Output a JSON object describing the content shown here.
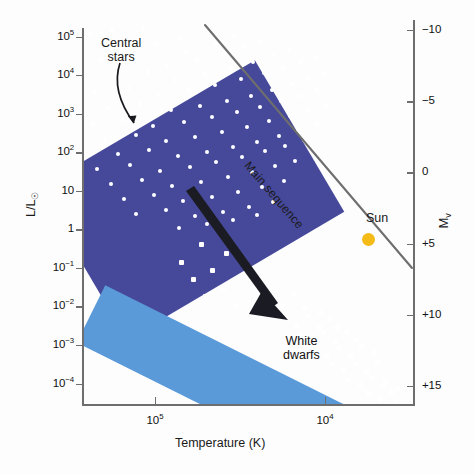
{
  "figure": {
    "kind": "hertzsprung-russell-diagram"
  },
  "axes": {
    "y_title_main": "L/L",
    "y_title_sub": "☉",
    "x_title": "Temperature (K)",
    "m_title_main": "M",
    "m_title_sub": "v",
    "y_ticks": [
      {
        "mantissa": "10",
        "exp": "5",
        "value": 100000
      },
      {
        "mantissa": "10",
        "exp": "4",
        "value": 10000
      },
      {
        "mantissa": "10",
        "exp": "3",
        "value": 1000
      },
      {
        "mantissa": "10",
        "exp": "2",
        "value": 100
      },
      {
        "mantissa": "10",
        "exp": "",
        "value": 10
      },
      {
        "mantissa": "1",
        "exp": "",
        "value": 1
      },
      {
        "mantissa": "10",
        "exp": "−1",
        "value": 0.1
      },
      {
        "mantissa": "10",
        "exp": "−2",
        "value": 0.01
      },
      {
        "mantissa": "10",
        "exp": "−3",
        "value": 0.001
      },
      {
        "mantissa": "10",
        "exp": "−4",
        "value": 0.0001
      }
    ],
    "x_ticks": [
      {
        "mantissa": "10",
        "exp": "5",
        "value": 100000
      },
      {
        "mantissa": "10",
        "exp": "4",
        "value": 10000
      }
    ],
    "m_ticks": [
      "−10",
      "−5",
      "0",
      "+5",
      "+10",
      "+15"
    ]
  },
  "annotations": {
    "central_stars_line1": "Central",
    "central_stars_line2": "stars",
    "white_dwarfs_line1": "White",
    "white_dwarfs_line2": "dwarfs",
    "main_sequence": "Main sequence",
    "sun": "Sun"
  },
  "colors": {
    "central_band": "#46499A",
    "white_dwarf_band": "#5B9AD8",
    "sun_marker": "#F4BA16",
    "axis": "#6E6E6E",
    "star_marker": "#FFFFFF",
    "evolution_arrow": "#1B1B23",
    "background": "#FDFDFD"
  },
  "chart_data": {
    "type": "scatter",
    "title": "",
    "xlabel": "Temperature (K)",
    "ylabel": "L/L☉",
    "y2label": "M_v",
    "xscale": "log-reversed",
    "yscale": "log",
    "xlim": [
      300000,
      7000
    ],
    "ylim": [
      3e-05,
      300000
    ],
    "y2lim": [
      -12,
      17
    ],
    "grid": false,
    "legend": "none",
    "xtick_values": [
      100000,
      10000
    ],
    "ytick_values": [
      100000,
      10000,
      1000,
      100,
      10,
      1,
      0.1,
      0.01,
      0.001,
      0.0001
    ],
    "y2tick_values": [
      -10,
      -5,
      0,
      5,
      10,
      15
    ],
    "regions": [
      {
        "name": "Central stars of planetary nebulae",
        "label": "Central stars",
        "color": "#46499A",
        "shape": "rotated-rectangle",
        "approx_luminosity_range": [
          3,
          100000
        ],
        "approx_temperature_range": [
          200000,
          25000
        ]
      },
      {
        "name": "White dwarf cooling track",
        "label": "White dwarfs",
        "color": "#5B9AD8",
        "shape": "rotated-band",
        "approx_luminosity_range": [
          8e-05,
          8
        ],
        "approx_temperature_range": [
          150000,
          7000
        ]
      }
    ],
    "series": [
      {
        "name": "Central stars",
        "marker": "white circle",
        "count": 108,
        "points": [
          [
            5,
            12
          ],
          [
            27,
            8
          ],
          [
            58,
            5
          ],
          [
            96,
            17
          ],
          [
            119,
            6
          ],
          [
            40,
            24
          ],
          [
            71,
            21
          ],
          [
            101,
            29
          ],
          [
            131,
            22
          ],
          [
            149,
            13
          ],
          [
            16,
            38
          ],
          [
            49,
            34
          ],
          [
            82,
            44
          ],
          [
            112,
            37
          ],
          [
            138,
            32
          ],
          [
            160,
            25
          ],
          [
            176,
            19
          ],
          [
            30,
            55
          ],
          [
            63,
            50
          ],
          [
            90,
            58
          ],
          [
            120,
            52
          ],
          [
            146,
            46
          ],
          [
            168,
            40
          ],
          [
            188,
            33
          ],
          [
            204,
            28
          ],
          [
            10,
            70
          ],
          [
            44,
            66
          ],
          [
            74,
            73
          ],
          [
            104,
            68
          ],
          [
            130,
            63
          ],
          [
            156,
            57
          ],
          [
            179,
            51
          ],
          [
            198,
            45
          ],
          [
            216,
            40
          ],
          [
            231,
            35
          ],
          [
            23,
            86
          ],
          [
            55,
            82
          ],
          [
            86,
            88
          ],
          [
            115,
            84
          ],
          [
            142,
            79
          ],
          [
            166,
            74
          ],
          [
            187,
            68
          ],
          [
            207,
            62
          ],
          [
            224,
            57
          ],
          [
            240,
            51
          ],
          [
            8,
            101
          ],
          [
            38,
            98
          ],
          [
            68,
            104
          ],
          [
            99,
            100
          ],
          [
            127,
            95
          ],
          [
            152,
            90
          ],
          [
            175,
            85
          ],
          [
            196,
            79
          ],
          [
            214,
            74
          ],
          [
            232,
            68
          ],
          [
            20,
            117
          ],
          [
            51,
            113
          ],
          [
            81,
            119
          ],
          [
            110,
            115
          ],
          [
            137,
            110
          ],
          [
            162,
            105
          ],
          [
            184,
            99
          ],
          [
            205,
            94
          ],
          [
            223,
            88
          ],
          [
            241,
            83
          ],
          [
            33,
            132
          ],
          [
            64,
            128
          ],
          [
            93,
            134
          ],
          [
            122,
            130
          ],
          [
            148,
            125
          ],
          [
            172,
            120
          ],
          [
            194,
            114
          ],
          [
            213,
            109
          ],
          [
            232,
            103
          ],
          [
            12,
            147
          ],
          [
            45,
            143
          ],
          [
            75,
            149
          ],
          [
            105,
            145
          ],
          [
            131,
            140
          ],
          [
            157,
            135
          ],
          [
            180,
            129
          ],
          [
            200,
            124
          ],
          [
            219,
            118
          ],
          [
            26,
            162
          ],
          [
            57,
            158
          ],
          [
            87,
            164
          ],
          [
            116,
            160
          ],
          [
            143,
            155
          ],
          [
            167,
            150
          ],
          [
            190,
            144
          ],
          [
            210,
            139
          ],
          [
            39,
            177
          ],
          [
            69,
            173
          ],
          [
            98,
            179
          ],
          [
            127,
            175
          ],
          [
            153,
            170
          ],
          [
            177,
            165
          ],
          [
            199,
            159
          ],
          [
            51,
            192
          ],
          [
            81,
            188
          ],
          [
            110,
            194
          ],
          [
            138,
            190
          ],
          [
            164,
            185
          ],
          [
            188,
            180
          ],
          [
            94,
            206
          ],
          [
            122,
            202
          ],
          [
            148,
            198
          ],
          [
            172,
            193
          ]
        ]
      },
      {
        "name": "White dwarfs",
        "marker": "white square",
        "count": 56,
        "points": [
          [
            116,
            222
          ],
          [
            141,
            231
          ],
          [
            96,
            240
          ],
          [
            127,
            248
          ],
          [
            155,
            238
          ],
          [
            108,
            257
          ],
          [
            138,
            266
          ],
          [
            166,
            256
          ],
          [
            120,
            274
          ],
          [
            150,
            283
          ],
          [
            186,
            275
          ],
          [
            197,
            283
          ],
          [
            208,
            272
          ],
          [
            219,
            286
          ],
          [
            200,
            296
          ],
          [
            211,
            303
          ],
          [
            223,
            294
          ],
          [
            234,
            305
          ],
          [
            245,
            296
          ],
          [
            214,
            313
          ],
          [
            226,
            318
          ],
          [
            238,
            310
          ],
          [
            250,
            319
          ],
          [
            261,
            309
          ],
          [
            229,
            327
          ],
          [
            241,
            333
          ],
          [
            253,
            326
          ],
          [
            265,
            334
          ],
          [
            276,
            324
          ],
          [
            246,
            342
          ],
          [
            258,
            348
          ],
          [
            270,
            341
          ],
          [
            281,
            349
          ],
          [
            292,
            340
          ],
          [
            263,
            357
          ],
          [
            275,
            362
          ],
          [
            287,
            356
          ],
          [
            298,
            363
          ],
          [
            283,
            371
          ],
          [
            294,
            377
          ],
          [
            306,
            370
          ],
          [
            299,
            385
          ],
          [
            311,
            380
          ],
          [
            322,
            388
          ],
          [
            318,
            396
          ],
          [
            330,
            391
          ],
          [
            336,
            404
          ],
          [
            348,
            399
          ],
          [
            355,
            412
          ],
          [
            367,
            407
          ],
          [
            300,
            359
          ],
          [
            312,
            366
          ],
          [
            289,
            330
          ],
          [
            270,
            318
          ],
          [
            252,
            305
          ],
          [
            235,
            290
          ]
        ]
      }
    ],
    "markers": [
      {
        "name": "Sun",
        "label": "Sun",
        "temperature": 5800,
        "luminosity": 1,
        "absolute_magnitude": 4.8,
        "color": "#F4BA16"
      }
    ],
    "lines": [
      {
        "name": "Main sequence",
        "label": "Main sequence",
        "color": "#6E6E6E",
        "style": "solid"
      }
    ],
    "arrows": [
      {
        "name": "White dwarf cooling/evolution arrow",
        "color": "#1B1B23",
        "direction": "down-right"
      },
      {
        "name": "Central stars pointer",
        "color": "#1B1B23",
        "direction": "down-right"
      }
    ]
  }
}
